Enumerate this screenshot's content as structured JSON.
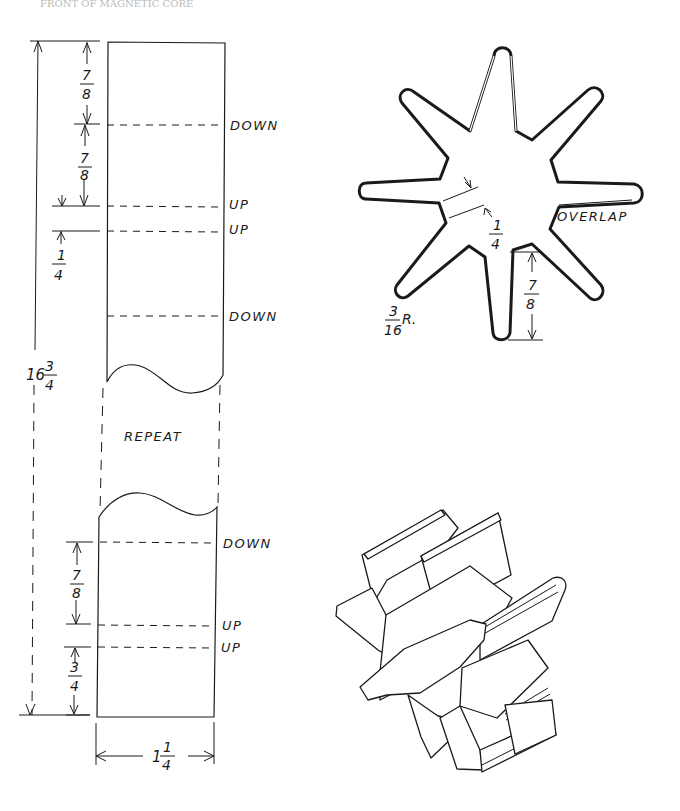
{
  "header": {
    "text": "FRONT OF MAGNETIC CORE"
  },
  "strip": {
    "fold_labels": [
      "DOWN",
      "UP",
      "UP",
      "DOWN",
      "DOWN",
      "UP",
      "UP"
    ],
    "repeat_label": "REPEAT",
    "dimensions": {
      "top_segment_1": {
        "num": "7",
        "den": "8"
      },
      "top_segment_2": {
        "num": "7",
        "den": "8"
      },
      "gap_1": {
        "num": "1",
        "den": "4"
      },
      "bottom_segment_1": {
        "num": "7",
        "den": "8"
      },
      "bottom_segment_2": {
        "num": "3",
        "den": "4"
      },
      "overall_length": {
        "whole": "16",
        "num": "3",
        "den": "4"
      },
      "width": {
        "whole": "1",
        "num": "1",
        "den": "4"
      }
    }
  },
  "star_section": {
    "arm_count": 8,
    "overlap_label": "OVERLAP",
    "arm_width": {
      "num": "1",
      "den": "4"
    },
    "arm_length": {
      "num": "7",
      "den": "8"
    },
    "tip_radius": {
      "num": "3",
      "den": "16",
      "suffix": "R."
    }
  },
  "isometric_view": {
    "description": "eight-pointed folded star, isometric"
  }
}
